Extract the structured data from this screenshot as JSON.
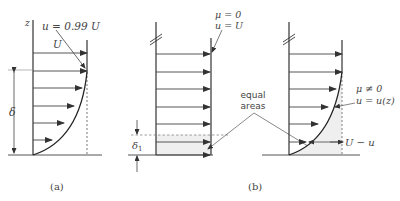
{
  "figure": {
    "panel_a": {
      "caption": "(a)",
      "axis_label": "z",
      "edge_label": "u = 0.99 U",
      "freestream_label": "U",
      "thickness_label": "δ"
    },
    "panel_b": {
      "caption": "(b)",
      "inviscid": {
        "viscosity_label": "μ = 0",
        "velocity_label": "u = U"
      },
      "viscous": {
        "viscosity_label": "μ ≠ 0",
        "velocity_label": "u = u(z)",
        "deficit_label": "U − u"
      },
      "displacement_label": "δ",
      "displacement_subscript": "1",
      "equal_areas_line1": "equal",
      "equal_areas_line2": "areas"
    },
    "colors": {
      "line": "#333333",
      "shade": "#ececec",
      "text": "#444444"
    }
  }
}
